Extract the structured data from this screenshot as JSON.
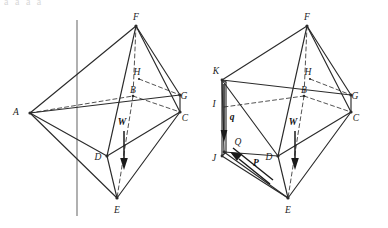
{
  "figure": {
    "top_clipped_text": "a a a a",
    "panels": [
      {
        "id": "left-panel",
        "name": "bipyramid-without-forces",
        "labels": [
          {
            "key": "F",
            "text": "F",
            "x": 136,
            "y": 18
          },
          {
            "key": "H",
            "text": "H",
            "x": 137,
            "y": 73
          },
          {
            "key": "B",
            "text": "B",
            "x": 133,
            "y": 91
          },
          {
            "key": "A",
            "text": "A",
            "x": 16,
            "y": 113
          },
          {
            "key": "G",
            "text": "G",
            "x": 184,
            "y": 97
          },
          {
            "key": "C",
            "text": "C",
            "x": 185,
            "y": 119
          },
          {
            "key": "D",
            "text": "D",
            "x": 98,
            "y": 158
          },
          {
            "key": "E",
            "text": "E",
            "x": 117,
            "y": 211
          },
          {
            "key": "W",
            "text": "W",
            "x": 122,
            "y": 123,
            "bold": true
          }
        ]
      },
      {
        "id": "right-panel",
        "name": "bipyramid-with-forces-P-q",
        "labels": [
          {
            "key": "F",
            "text": "F",
            "x": 307,
            "y": 18
          },
          {
            "key": "H",
            "text": "H",
            "x": 308,
            "y": 73
          },
          {
            "key": "B",
            "text": "B",
            "x": 304,
            "y": 91
          },
          {
            "key": "K",
            "text": "K",
            "x": 216,
            "y": 72
          },
          {
            "key": "I",
            "text": "I",
            "x": 214,
            "y": 105
          },
          {
            "key": "G",
            "text": "G",
            "x": 355,
            "y": 97
          },
          {
            "key": "C",
            "text": "C",
            "x": 356,
            "y": 119
          },
          {
            "key": "J",
            "text": "J",
            "x": 214,
            "y": 159
          },
          {
            "key": "Q",
            "text": "Q",
            "x": 238,
            "y": 143
          },
          {
            "key": "D",
            "text": "D",
            "x": 269,
            "y": 158
          },
          {
            "key": "E",
            "text": "E",
            "x": 288,
            "y": 211
          },
          {
            "key": "W",
            "text": "W",
            "x": 293,
            "y": 123,
            "bold": true
          },
          {
            "key": "q",
            "text": "q",
            "x": 232,
            "y": 118,
            "bold": true
          },
          {
            "key": "P",
            "text": "P",
            "x": 256,
            "y": 164,
            "bold": true
          }
        ]
      }
    ],
    "vectors": [
      {
        "name": "weight-vector-left",
        "label": "W",
        "from": [
          124,
          131
        ],
        "to": [
          124,
          168
        ]
      },
      {
        "name": "weight-vector-right",
        "label": "W",
        "from": [
          295,
          131
        ],
        "to": [
          295,
          168
        ]
      },
      {
        "name": "force-q-right",
        "label": "q",
        "from": [
          224,
          78
        ],
        "to": [
          224,
          140
        ]
      },
      {
        "name": "force-P-right",
        "label": "P",
        "from": [
          268,
          182
        ],
        "to": [
          231,
          152
        ]
      }
    ],
    "axis": {
      "name": "vertical-symmetry-axis",
      "x": 77,
      "y1": 20,
      "y2": 216
    },
    "colors": {
      "solid_edge": "#2b2b2b",
      "hidden_edge": "#4a4a4a",
      "axis": "#6a6a6a",
      "vector": "#1a1a1a",
      "background": "#ffffff"
    }
  }
}
